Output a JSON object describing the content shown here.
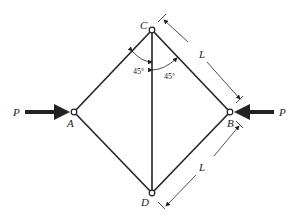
{
  "diagram": {
    "type": "truss",
    "joints": {
      "A": {
        "label": "A",
        "x": 74,
        "y": 112
      },
      "B": {
        "label": "B",
        "x": 230,
        "y": 112
      },
      "C": {
        "label": "C",
        "x": 152,
        "y": 30
      },
      "D": {
        "label": "D",
        "x": 152,
        "y": 193
      }
    },
    "members": [
      [
        "A",
        "C"
      ],
      [
        "C",
        "B"
      ],
      [
        "B",
        "D"
      ],
      [
        "D",
        "A"
      ],
      [
        "C",
        "D"
      ]
    ],
    "loads": {
      "left": "P",
      "right": "P"
    },
    "angles": {
      "left": "45°",
      "right": "45°"
    },
    "dimensions": {
      "upper": "L",
      "lower": "L"
    },
    "colors": {
      "line": "#222222",
      "background": "#ffffff"
    }
  }
}
